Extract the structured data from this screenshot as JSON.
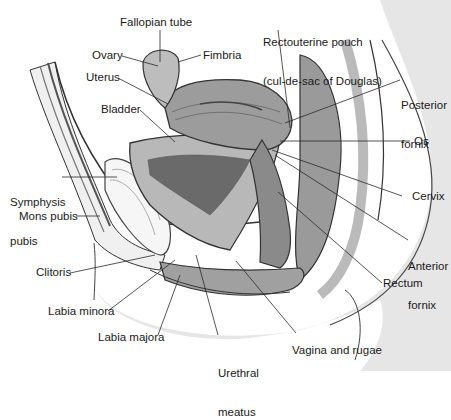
{
  "figure": {
    "colors": {
      "background": "#ffffff",
      "skin_shade": "#e6e6e6",
      "tissue_light": "#d8d8d8",
      "tissue_mid": "#a8a8a8",
      "tissue_dark": "#6e6e6e",
      "cavity_dark": "#5a5a5a",
      "outline": "#333333",
      "leader_line": "#2a2a2a",
      "label_text": "#1a1a1a"
    }
  },
  "labels": {
    "fallopian_tube": "Fallopian tube",
    "ovary": "Ovary",
    "fimbria": "Fimbria",
    "uterus": "Uterus",
    "bladder": "Bladder",
    "rectouterine_pouch_line1": "Rectouterine pouch",
    "rectouterine_pouch_line2": "(cul-de-sac of Douglas)",
    "posterior_fornix_line1": "Posterior",
    "posterior_fornix_line2": "fornix",
    "os": "Os",
    "symphysis_pubis_line1": "Symphysis",
    "symphysis_pubis_line2": "pubis",
    "mons_pubis": "Mons pubis",
    "cervix": "Cervix",
    "anterior_fornix_line1": "Anterior",
    "anterior_fornix_line2": "fornix",
    "clitoris": "Clitoris",
    "rectum": "Rectum",
    "labia_minora": "Labia minora",
    "labia_majora": "Labia majora",
    "urethral_meatus_line1": "Urethral",
    "urethral_meatus_line2": "meatus",
    "vagina_and_rugae": "Vagina and rugae"
  }
}
